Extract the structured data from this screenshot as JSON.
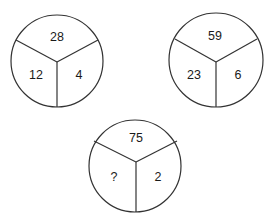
{
  "puzzle": {
    "circles": [
      {
        "top": "28",
        "left": "12",
        "right": "4"
      },
      {
        "top": "59",
        "left": "23",
        "right": "6"
      },
      {
        "top": "75",
        "left": "?",
        "right": "2"
      }
    ]
  },
  "colors": {
    "stroke": "#333333",
    "text": "#1a1a1a",
    "background": "#ffffff"
  }
}
